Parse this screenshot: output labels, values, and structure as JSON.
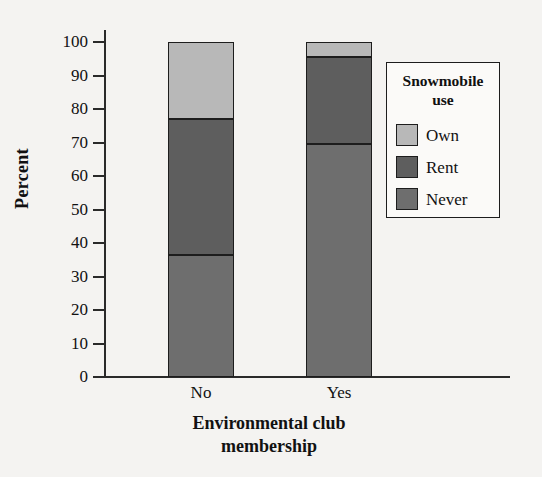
{
  "chart_data": {
    "type": "bar",
    "subtype": "stacked-bar-100-percent",
    "title": "",
    "xlabel": "Environmental club membership",
    "ylabel": "Percent",
    "categories": [
      "No",
      "Yes"
    ],
    "ylim": [
      0,
      100
    ],
    "ytick_labels": [
      "0",
      "10",
      "20",
      "30",
      "40",
      "50",
      "60",
      "70",
      "80",
      "90",
      "100"
    ],
    "ytick_values": [
      0,
      10,
      20,
      30,
      40,
      50,
      60,
      70,
      80,
      90,
      100
    ],
    "grid": false,
    "legend_position": "right",
    "legend_title": "Snowmobile use",
    "series": [
      {
        "name": "Never",
        "values": [
          36.5,
          69.5
        ],
        "color": "#6e6e6e"
      },
      {
        "name": "Rent",
        "values": [
          40.5,
          26.0
        ],
        "color": "#5e5e5e"
      },
      {
        "name": "Own",
        "values": [
          23.0,
          4.5
        ],
        "color": "#b8b8b8"
      }
    ],
    "cumulative_tops": {
      "No": {
        "never": 36.5,
        "rent": 77.0,
        "own": 100.0
      },
      "Yes": {
        "never": 69.5,
        "rent": 95.5,
        "own": 100.0
      }
    }
  },
  "axes": {
    "y_label": "Percent",
    "x_title_line1": "Environmental club",
    "x_title_line2": "membership",
    "x_tick_labels": [
      "No",
      "Yes"
    ],
    "y_tick_labels": [
      "100",
      "90",
      "80",
      "70",
      "60",
      "50",
      "40",
      "30",
      "20",
      "10",
      "0"
    ]
  },
  "legend": {
    "title_line1": "Snowmobile",
    "title_line2": "use",
    "items": [
      {
        "label": "Own",
        "color": "#b8b8b8"
      },
      {
        "label": "Rent",
        "color": "#5e5e5e"
      },
      {
        "label": "Never",
        "color": "#6e6e6e"
      }
    ]
  },
  "colors": {
    "background": "#f4f3f1",
    "axis": "#2a2a2a",
    "outline": "#1d1d1d",
    "own": "#b8b8b8",
    "rent": "#5e5e5e",
    "never": "#6e6e6e"
  }
}
